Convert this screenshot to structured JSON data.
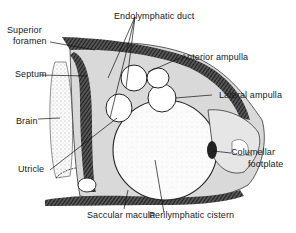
{
  "figure": {
    "type": "anatomical-section-diagram",
    "labels": {
      "endolymphatic_duct": "Endolymphatic duct",
      "superior_foramen_line1": "Superior",
      "superior_foramen_line2": "foramen",
      "anterior_ampulla": "Anterior ampulla",
      "septum": "Septum",
      "lateral_ampulla": "Lateral ampulla",
      "brain": "Brain",
      "columellar_footplate_line1": "Columellar",
      "columellar_footplate_line2": "footplate",
      "utricle": "Utricle",
      "saccular_macula": "Saccular macula",
      "perilymphatic_cistern": "Perilymphatic cistern"
    },
    "caption_fragment": ""
  }
}
